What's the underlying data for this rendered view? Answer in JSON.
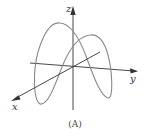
{
  "figure": {
    "caption": "(A)",
    "axes": {
      "x_label": "x",
      "y_label": "y",
      "z_label": "z"
    },
    "colors": {
      "curve": "#8a8a8a",
      "axes": "#333333",
      "background": "#ffffff"
    }
  }
}
